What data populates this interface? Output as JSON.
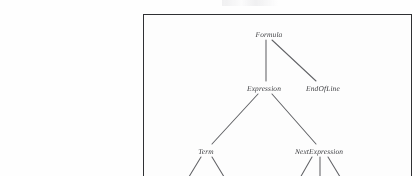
{
  "figure": {
    "type": "parse-tree-diagram",
    "frame_color": "#2f3033",
    "background_color": "#fdfdfd",
    "text_color": "#3c3d40",
    "edge_color": "#55565a",
    "nodes": [
      {
        "id": "formula",
        "label": "Formula",
        "level": 0
      },
      {
        "id": "expression",
        "label": "Expression",
        "level": 1
      },
      {
        "id": "endofline",
        "label": "EndOfLine",
        "level": 1
      },
      {
        "id": "term",
        "label": "Term",
        "level": 2
      },
      {
        "id": "nextexpression",
        "label": "NextExpression",
        "level": 2
      }
    ],
    "edges": [
      {
        "from": "formula",
        "to": "expression"
      },
      {
        "from": "formula",
        "to": "endofline"
      },
      {
        "from": "expression",
        "to": "term"
      },
      {
        "from": "expression",
        "to": "nextexpression"
      },
      {
        "from": "term",
        "to": "clipped-child-1"
      },
      {
        "from": "term",
        "to": "clipped-child-2"
      },
      {
        "from": "nextexpression",
        "to": "clipped-child-3"
      },
      {
        "from": "nextexpression",
        "to": "clipped-child-4"
      },
      {
        "from": "nextexpression",
        "to": "clipped-child-5"
      }
    ]
  }
}
